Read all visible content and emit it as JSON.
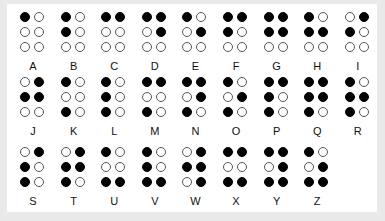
{
  "letters": [
    {
      "label": "A",
      "dots": [
        1,
        0,
        0,
        0,
        0,
        0
      ]
    },
    {
      "label": "B",
      "dots": [
        1,
        0,
        1,
        0,
        0,
        0
      ]
    },
    {
      "label": "C",
      "dots": [
        1,
        1,
        0,
        0,
        0,
        0
      ]
    },
    {
      "label": "D",
      "dots": [
        1,
        1,
        0,
        1,
        0,
        0
      ]
    },
    {
      "label": "E",
      "dots": [
        1,
        0,
        0,
        1,
        0,
        0
      ]
    },
    {
      "label": "F",
      "dots": [
        1,
        1,
        1,
        0,
        0,
        0
      ]
    },
    {
      "label": "G",
      "dots": [
        1,
        1,
        1,
        1,
        0,
        0
      ]
    },
    {
      "label": "H",
      "dots": [
        1,
        0,
        1,
        1,
        0,
        0
      ]
    },
    {
      "label": "I",
      "dots": [
        0,
        1,
        1,
        0,
        0,
        0
      ]
    },
    {
      "label": "J",
      "dots": [
        0,
        1,
        1,
        1,
        0,
        0
      ]
    },
    {
      "label": "K",
      "dots": [
        1,
        0,
        0,
        0,
        1,
        0
      ]
    },
    {
      "label": "L",
      "dots": [
        1,
        0,
        1,
        0,
        1,
        0
      ]
    },
    {
      "label": "M",
      "dots": [
        1,
        1,
        0,
        0,
        1,
        0
      ]
    },
    {
      "label": "N",
      "dots": [
        1,
        1,
        0,
        1,
        1,
        0
      ]
    },
    {
      "label": "O",
      "dots": [
        1,
        0,
        0,
        1,
        1,
        0
      ]
    },
    {
      "label": "P",
      "dots": [
        1,
        1,
        1,
        0,
        1,
        0
      ]
    },
    {
      "label": "Q",
      "dots": [
        1,
        1,
        1,
        1,
        1,
        0
      ]
    },
    {
      "label": "R",
      "dots": [
        1,
        0,
        1,
        1,
        1,
        0
      ]
    },
    {
      "label": "S",
      "dots": [
        0,
        1,
        1,
        0,
        1,
        0
      ]
    },
    {
      "label": "T",
      "dots": [
        0,
        1,
        1,
        1,
        1,
        0
      ]
    },
    {
      "label": "U",
      "dots": [
        1,
        0,
        0,
        0,
        1,
        1
      ]
    },
    {
      "label": "V",
      "dots": [
        1,
        0,
        1,
        0,
        1,
        1
      ]
    },
    {
      "label": "W",
      "dots": [
        0,
        1,
        1,
        1,
        0,
        1
      ]
    },
    {
      "label": "X",
      "dots": [
        1,
        1,
        0,
        0,
        1,
        1
      ]
    },
    {
      "label": "Y",
      "dots": [
        1,
        1,
        0,
        1,
        1,
        1
      ]
    },
    {
      "label": "Z",
      "dots": [
        1,
        0,
        0,
        1,
        1,
        1
      ]
    }
  ],
  "colors": {
    "raised": "#000000",
    "flat": "#ffffff",
    "background": "#e9e9e9",
    "card": "#ffffff"
  }
}
